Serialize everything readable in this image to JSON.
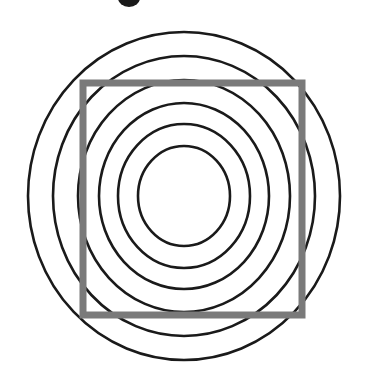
{
  "figure": {
    "canvas": {
      "width": 374,
      "height": 383,
      "background_color": "#ffffff"
    },
    "center": {
      "x": 184,
      "y": 196
    },
    "circle_color": "#1a1a1a",
    "circle_stroke_width": 2.6,
    "square_color": "#7a7a7a",
    "square_stroke_width": 7,
    "glyph_color": "#1a1a1a",
    "shape_count_label": "6 concentric rings, 1 square",
    "rings": [
      {
        "name": "ring-1-outermost",
        "rx": 156,
        "ry": 164,
        "index": 1
      },
      {
        "name": "ring-2",
        "rx": 131,
        "ry": 140,
        "index": 2
      },
      {
        "name": "ring-3",
        "rx": 106,
        "ry": 116,
        "index": 3
      },
      {
        "name": "ring-4",
        "rx": 85,
        "ry": 93,
        "index": 4
      },
      {
        "name": "ring-5",
        "rx": 66,
        "ry": 72,
        "index": 5
      },
      {
        "name": "ring-6-innermost",
        "rx": 46,
        "ry": 50,
        "index": 6
      }
    ],
    "square": {
      "name": "square-outline",
      "x": 83,
      "y": 83,
      "width": 219,
      "height": 232
    },
    "glyph_fragment": {
      "name": "cropped-glyph-top",
      "cx": 129,
      "cy": -2,
      "rx": 11,
      "ry": 9
    }
  }
}
